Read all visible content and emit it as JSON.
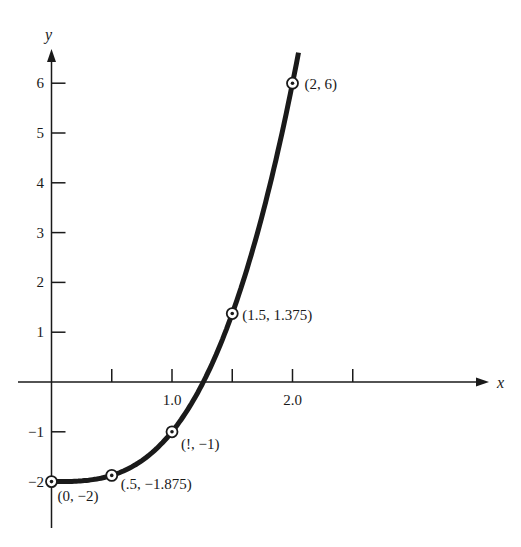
{
  "chart_data": {
    "type": "line",
    "title": "",
    "function": "y = x^3 - 2",
    "xlabel": "x",
    "ylabel": "y",
    "xlim": [
      0,
      2.5
    ],
    "ylim": [
      -2,
      6
    ],
    "grid": false,
    "legend": null,
    "x_ticks": [
      0.5,
      1.0,
      1.5,
      2.0,
      2.5
    ],
    "x_tick_labels": [
      {
        "value": 1.0,
        "label": "1.0"
      },
      {
        "value": 2.0,
        "label": "2.0"
      }
    ],
    "y_ticks": [
      {
        "value": 6,
        "label": "6"
      },
      {
        "value": 5,
        "label": "5"
      },
      {
        "value": 4,
        "label": "4"
      },
      {
        "value": 3,
        "label": "3"
      },
      {
        "value": 2,
        "label": "2"
      },
      {
        "value": 1,
        "label": "1"
      },
      {
        "value": -1,
        "label": "−1"
      },
      {
        "value": -2,
        "label": "−2"
      }
    ],
    "series": [
      {
        "name": "curve",
        "x": [
          0,
          0.5,
          1,
          1.5,
          2
        ],
        "y": [
          -2,
          -1.875,
          -1,
          1.375,
          6
        ]
      }
    ],
    "annotations": [
      {
        "x": 0,
        "y": -2,
        "label": "(0, −2)"
      },
      {
        "x": 0.5,
        "y": -1.875,
        "label": "(.5, −1.875)"
      },
      {
        "x": 1,
        "y": -1,
        "label": "(!, −1)"
      },
      {
        "x": 1.5,
        "y": 1.375,
        "label": "(1.5, 1.375)"
      },
      {
        "x": 2,
        "y": 6,
        "label": "(2, 6)"
      }
    ]
  },
  "colors": {
    "ink": "#1a1a1a",
    "background": "#ffffff"
  }
}
